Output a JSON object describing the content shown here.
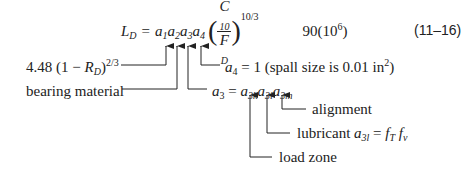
{
  "equation": {
    "lhs": "L",
    "lhs_sub": "D",
    "equals": "=",
    "factors": [
      {
        "sym": "a",
        "sub": "1"
      },
      {
        "sym": "a",
        "sub": "2"
      },
      {
        "sym": "a",
        "sub": "3"
      },
      {
        "sym": "a",
        "sub": "4"
      }
    ],
    "paren_open": "(",
    "paren_close": ")",
    "frac_num": "C",
    "frac_num_sub": "10",
    "frac_den": "F",
    "frac_den_sub": "D",
    "exponent": "10/3",
    "life_scale": "90(10",
    "life_scale_exp": "6",
    "life_scale_close": ")",
    "number": "(11–16)"
  },
  "annotations": {
    "a1_expr_prefix": "4.48 (1 − ",
    "a1_expr_R": "R",
    "a1_expr_R_sub": "D",
    "a1_expr_close": ")",
    "a1_expr_exp": "2/3",
    "a2_label": "bearing material",
    "a4_label_sym": "a",
    "a4_label_sub": "4",
    "a4_label_rest": " = 1 (spall size is 0.01 in",
    "a4_label_exp": "2",
    "a4_label_close": ")",
    "a3_label": {
      "sym": "a",
      "sub": "3",
      "eq": " = ",
      "terms": [
        {
          "sym": "a",
          "sub": "3k"
        },
        {
          "sym": "a",
          "sub": "3l"
        },
        {
          "sym": "a",
          "sub": "3m"
        }
      ]
    },
    "alignment_label": "alignment",
    "lubricant_label": "lubricant ",
    "lubricant_expr_sym": "a",
    "lubricant_expr_sub": "3l",
    "lubricant_expr_eq": " = ",
    "lubricant_fT": "f",
    "lubricant_fT_sub": "T",
    "lubricant_fv": "f",
    "lubricant_fv_sub": "v",
    "load_zone_label": "load zone"
  }
}
